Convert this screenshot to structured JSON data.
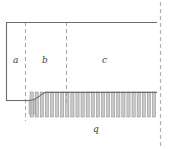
{
  "figure": {
    "background_color": "#ffffff",
    "line_color": "#6e6e6e",
    "dash_color": "#9a9a9a",
    "hatch_fill": "#c9c9c9",
    "hatch_edge": "#8a8a8a",
    "label_color": "#3d3d3d",
    "regions": [
      {
        "id": "a",
        "label": "a",
        "x_start": 6,
        "x_end": 25,
        "note": "leading inlet region"
      },
      {
        "id": "b",
        "label": "b",
        "x_start": 25,
        "x_end": 66,
        "note": "transition / ramp region"
      },
      {
        "id": "c",
        "label": "c",
        "x_start": 66,
        "x_end": 157,
        "note": "developed region"
      }
    ],
    "labels": {
      "region_a": "a",
      "region_b": "b",
      "region_c": "c",
      "flux": "q"
    },
    "dashed_dividers": [
      {
        "name": "divider-a-b",
        "x": 25,
        "y_top": 22,
        "y_bottom": 121
      },
      {
        "name": "divider-b-c",
        "x": 66,
        "y_top": 22,
        "y_bottom": 104
      },
      {
        "name": "far-field-line",
        "x": 160,
        "y_top": 2,
        "y_bottom": 147
      }
    ],
    "outline": {
      "top_y": 22,
      "left_x": 6,
      "right_x": 157,
      "left_wall_bottom_y": 100,
      "step_y": 100,
      "plate_y": 92,
      "ramp_start_x": 28,
      "ramp_end_x": 46
    },
    "hatching": {
      "teeth_count": 25,
      "x_start": 30,
      "x_end": 157,
      "top_y": 92,
      "bottom_y": 117,
      "tooth_width": 3.2
    }
  }
}
